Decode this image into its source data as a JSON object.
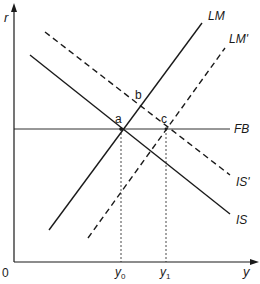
{
  "diagram": {
    "type": "IS-LM-FB macroeconomic diagram",
    "axes": {
      "y_label": "r",
      "x_label": "y",
      "origin_label": "0"
    },
    "curves": [
      {
        "id": "IS",
        "label": "IS",
        "style": "solid"
      },
      {
        "id": "LM",
        "label": "LM",
        "style": "solid"
      },
      {
        "id": "IS_prime",
        "label": "IS'",
        "style": "dashed"
      },
      {
        "id": "LM_prime",
        "label": "LM'",
        "style": "dashed"
      },
      {
        "id": "FB",
        "label": "FB",
        "style": "solid-thin"
      }
    ],
    "points": [
      {
        "id": "a",
        "label": "a"
      },
      {
        "id": "b",
        "label": "b"
      },
      {
        "id": "c",
        "label": "c"
      }
    ],
    "x_ticks": [
      {
        "id": "y0",
        "base": "y",
        "sub": "0"
      },
      {
        "id": "y1",
        "base": "y",
        "sub": "1"
      }
    ]
  },
  "colors": {
    "line": "#1a1a1a",
    "background": "#ffffff"
  }
}
